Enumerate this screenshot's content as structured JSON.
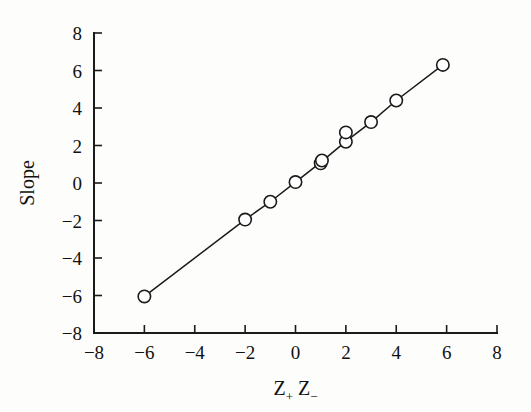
{
  "chart_data": {
    "type": "scatter",
    "title": "",
    "xlabel": "Z+ Z-",
    "xlabel_parts": {
      "base1": "Z",
      "sub1": "+",
      "base2": "Z",
      "sub2": "−"
    },
    "ylabel": "Slope",
    "xlim": [
      -8,
      8
    ],
    "ylim": [
      -8,
      8
    ],
    "xticks": [
      -8,
      -6,
      -4,
      -2,
      0,
      2,
      4,
      6,
      8
    ],
    "yticks": [
      -8,
      -6,
      -4,
      -2,
      0,
      2,
      4,
      6,
      8
    ],
    "xticklabels": [
      "−8",
      "−6",
      "−4",
      "−2",
      "0",
      "2",
      "4",
      "6",
      "8"
    ],
    "yticklabels": [
      "−8",
      "−6",
      "−4",
      "−2",
      "0",
      "2",
      "4",
      "6",
      "8"
    ],
    "grid": false,
    "legend": null,
    "marker": "open-circle",
    "line_style": "solid",
    "series": [
      {
        "name": "Slope vs Z+Z-",
        "points": [
          {
            "x": -6.0,
            "y": -6.05
          },
          {
            "x": -2.0,
            "y": -1.95
          },
          {
            "x": -1.0,
            "y": -1.0
          },
          {
            "x": 0.0,
            "y": 0.05
          },
          {
            "x": 1.0,
            "y": 1.05
          },
          {
            "x": 1.05,
            "y": 1.2
          },
          {
            "x": 2.0,
            "y": 2.2
          },
          {
            "x": 2.0,
            "y": 2.7
          },
          {
            "x": 3.0,
            "y": 3.25
          },
          {
            "x": 4.0,
            "y": 4.4
          },
          {
            "x": 5.85,
            "y": 6.3
          }
        ],
        "line_through": [
          {
            "x": -6.0,
            "y": -6.05
          },
          {
            "x": -2.0,
            "y": -1.95
          },
          {
            "x": -1.0,
            "y": -1.0
          },
          {
            "x": 0.0,
            "y": 0.05
          },
          {
            "x": 1.0,
            "y": 1.1
          },
          {
            "x": 2.0,
            "y": 2.22
          },
          {
            "x": 3.0,
            "y": 3.25
          },
          {
            "x": 4.0,
            "y": 4.4
          },
          {
            "x": 5.85,
            "y": 6.3
          }
        ]
      }
    ]
  },
  "figure": {
    "background": "#fdfdfc",
    "foreground": "#1a1a1a",
    "plot_left_px": 94,
    "plot_right_px": 497,
    "plot_top_px": 33,
    "plot_bottom_px": 333
  }
}
